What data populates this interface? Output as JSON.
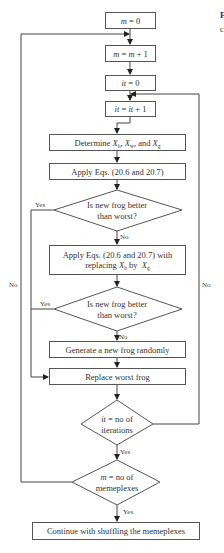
{
  "diagram": {
    "type": "flowchart",
    "nodes": {
      "init_m": {
        "shape": "process",
        "var": "m",
        "text": " = 0"
      },
      "inc_m": {
        "shape": "process",
        "var": "m",
        "mid": " = ",
        "var2": "m",
        "text": " + 1"
      },
      "init_it": {
        "shape": "process",
        "var": "it",
        "text": " = 0"
      },
      "inc_it": {
        "shape": "process",
        "var": "it",
        "mid": " = ",
        "var2": "it",
        "text": " + 1"
      },
      "determine": {
        "shape": "process",
        "prefix": "Determine ",
        "x1": "X",
        "s1": "b",
        "sep1": ", ",
        "x2": "X",
        "s2": "w",
        "sep2": ", and ",
        "x3": "X",
        "s3": "g"
      },
      "apply": {
        "shape": "process",
        "text": "Apply Eqs. (20.6 and 20.7)"
      },
      "decision1": {
        "shape": "decision",
        "line1": "Is new frog better",
        "line2": "than worst?"
      },
      "apply_replace": {
        "shape": "process",
        "line1": "Apply Eqs. (20.6 and 20.7) with",
        "prefix2": "replacing ",
        "x1": "X",
        "s1": "b",
        "mid2": " by  ",
        "x2": "X",
        "s2": "g"
      },
      "decision2": {
        "shape": "decision",
        "line1": "Is new frog better",
        "line2": "than worst?"
      },
      "generate": {
        "shape": "process",
        "text": "Generate a new frog randomly"
      },
      "replace": {
        "shape": "process",
        "text": "Replace worst frog"
      },
      "decision3": {
        "shape": "decision",
        "var": "it",
        "line1": " = no of",
        "line2": "iterations"
      },
      "decision4": {
        "shape": "decision",
        "var": "m",
        "line1": " = no of",
        "line2": "memeplexes"
      },
      "continue": {
        "shape": "process",
        "text": "Continue with shuffling the memeplexes"
      }
    },
    "edge_labels": {
      "d1_no": "No",
      "d1_yes": "Yes",
      "d2_no": "No",
      "d2_yes": "Yes",
      "d3_yes": "Yes",
      "d3_no": "No",
      "d4_yes": "Yes",
      "d4_no": "No"
    },
    "edges": [
      {
        "from": "init_m",
        "to": "inc_m"
      },
      {
        "from": "inc_m",
        "to": "init_it"
      },
      {
        "from": "init_it",
        "to": "inc_it"
      },
      {
        "from": "inc_it",
        "to": "determine"
      },
      {
        "from": "determine",
        "to": "apply"
      },
      {
        "from": "apply",
        "to": "decision1"
      },
      {
        "from": "decision1",
        "to": "apply_replace",
        "label": "No"
      },
      {
        "from": "decision1",
        "to": "replace",
        "label": "Yes"
      },
      {
        "from": "apply_replace",
        "to": "decision2"
      },
      {
        "from": "decision2",
        "to": "generate",
        "label": "No"
      },
      {
        "from": "decision2",
        "to": "replace",
        "label": "Yes"
      },
      {
        "from": "generate",
        "to": "replace"
      },
      {
        "from": "replace",
        "to": "decision3"
      },
      {
        "from": "decision3",
        "to": "inc_it",
        "label": "No"
      },
      {
        "from": "decision3",
        "to": "decision4",
        "label": "Yes"
      },
      {
        "from": "decision4",
        "to": "inc_m",
        "label": "No"
      },
      {
        "from": "decision4",
        "to": "continue",
        "label": "Yes"
      }
    ],
    "margin_fragments": {
      "top": "F",
      "bottom": "c"
    }
  }
}
